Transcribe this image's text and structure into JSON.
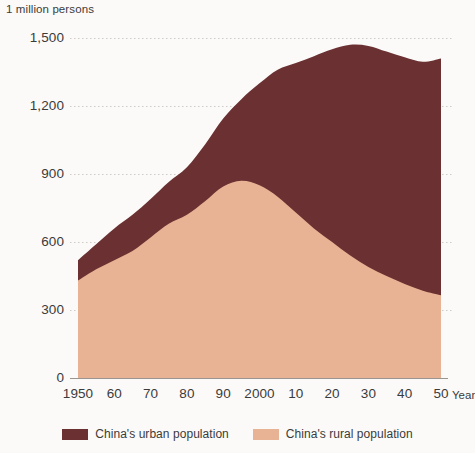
{
  "header": {
    "unit_label": "1 million persons"
  },
  "axes": {
    "y_label": "",
    "y_ticks": [
      "0",
      "300",
      "600",
      "900",
      "1,200",
      "1,500"
    ],
    "y_tick_values": [
      0,
      300,
      600,
      900,
      1200,
      1500
    ],
    "x_ticks": [
      "1950",
      "60",
      "70",
      "80",
      "90",
      "2000",
      "10",
      "20",
      "30",
      "40",
      "50"
    ],
    "x_tick_values": [
      1950,
      1960,
      1970,
      1980,
      1990,
      2000,
      2010,
      2020,
      2030,
      2040,
      2050
    ],
    "x_axis_name": "Year"
  },
  "legend": {
    "items": [
      {
        "label": "China's urban population",
        "color": "#6b3032",
        "swatch_name": "legend-swatch-urban"
      },
      {
        "label": "China's rural population",
        "color": "#e8b394",
        "swatch_name": "legend-swatch-rural"
      }
    ]
  },
  "colors": {
    "urban": "#6b3032",
    "rural": "#e8b394",
    "background": "#fbfaf8",
    "gridline": "#cfcbc6",
    "axis": "#9a958f",
    "text": "#3b3b3b"
  },
  "chart_data": {
    "type": "area",
    "stacked": true,
    "title": "",
    "subtitle": "",
    "xlabel": "Year",
    "ylabel": "1 million persons",
    "xlim": [
      1950,
      2050
    ],
    "ylim": [
      0,
      1500
    ],
    "grid": true,
    "legend_position": "bottom",
    "x": [
      1950,
      1955,
      1960,
      1965,
      1970,
      1975,
      1980,
      1985,
      1990,
      1995,
      2000,
      2005,
      2010,
      2015,
      2020,
      2025,
      2030,
      2035,
      2040,
      2045,
      2050
    ],
    "series": [
      {
        "name": "China's rural population",
        "color": "#e8b394",
        "values": [
          430,
          480,
          520,
          560,
          620,
          680,
          720,
          780,
          845,
          870,
          850,
          800,
          730,
          660,
          600,
          540,
          490,
          450,
          415,
          385,
          365
        ]
      },
      {
        "name": "China's urban population",
        "color": "#6b3032",
        "values": [
          90,
          110,
          140,
          160,
          170,
          185,
          210,
          250,
          300,
          360,
          450,
          560,
          660,
          760,
          850,
          930,
          975,
          990,
          1000,
          1010,
          1045
        ]
      }
    ],
    "totals": [
      520,
      590,
      660,
      720,
      790,
      865,
      930,
      1030,
      1145,
      1230,
      1300,
      1360,
      1390,
      1420,
      1450,
      1470,
      1465,
      1440,
      1415,
      1395,
      1410
    ]
  }
}
